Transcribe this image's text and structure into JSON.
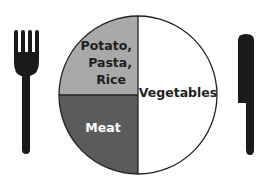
{
  "diagram": {
    "type": "plate-model",
    "sections": [
      {
        "id": "starch",
        "lines": [
          "Potato,",
          "Pasta,",
          "Rice"
        ],
        "portion": "quarter",
        "position": "top-left",
        "fill": "#a9a9a9",
        "text_color": "#1e1e1e"
      },
      {
        "id": "meat",
        "lines": [
          "Meat"
        ],
        "portion": "quarter",
        "position": "bottom-left",
        "fill": "#5b5b5b",
        "text_color": "#ffffff"
      },
      {
        "id": "vegetables",
        "lines": [
          "Vegetables"
        ],
        "portion": "half",
        "position": "right",
        "fill": "#ffffff",
        "text_color": "#1e1e1e"
      }
    ],
    "utensils": {
      "left": "fork",
      "right": "knife"
    },
    "colors": {
      "outline": "#222222",
      "utensil": "#1a1a1a"
    }
  }
}
